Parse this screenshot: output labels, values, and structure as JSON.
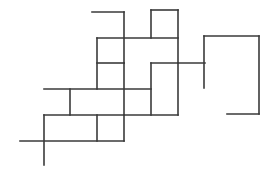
{
  "canvas": {
    "width": 269,
    "height": 176,
    "background_color": "#ffffff",
    "title": "orthogonal-line-drawing"
  },
  "style": {
    "stroke_color": "#3a3a3a",
    "stroke_width": 1.6,
    "fill": "none",
    "line_cap": "square",
    "line_join": "miter"
  },
  "figure": {
    "segment_count": 24
  },
  "segments": [
    {
      "name": "top-left-horizontal",
      "orientation": "horizontal",
      "x1": 92,
      "y1": 12,
      "x2": 124,
      "y2": 12
    },
    {
      "name": "top-left-vertical",
      "orientation": "vertical",
      "x1": 124,
      "y1": 12,
      "x2": 124,
      "y2": 63
    },
    {
      "name": "top-square-top-edge",
      "orientation": "horizontal",
      "x1": 151,
      "y1": 10,
      "x2": 178,
      "y2": 10
    },
    {
      "name": "top-square-left-edge",
      "orientation": "vertical",
      "x1": 151,
      "y1": 10,
      "x2": 151,
      "y2": 38
    },
    {
      "name": "top-square-right-edge",
      "orientation": "vertical",
      "x1": 178,
      "y1": 10,
      "x2": 178,
      "y2": 63
    },
    {
      "name": "upper-mid-horizontal",
      "orientation": "horizontal",
      "x1": 97,
      "y1": 38,
      "x2": 178,
      "y2": 38
    },
    {
      "name": "upper-left-vertical",
      "orientation": "vertical",
      "x1": 97,
      "y1": 38,
      "x2": 97,
      "y2": 89
    },
    {
      "name": "center-vertical-long",
      "orientation": "vertical",
      "x1": 124,
      "y1": 63,
      "x2": 124,
      "y2": 115
    },
    {
      "name": "center-left-horizontal",
      "orientation": "horizontal",
      "x1": 97,
      "y1": 63,
      "x2": 124,
      "y2": 63
    },
    {
      "name": "right-connector-horizontal",
      "orientation": "horizontal",
      "x1": 151,
      "y1": 63,
      "x2": 205,
      "y2": 63
    },
    {
      "name": "right-shape-left-vertical",
      "orientation": "vertical",
      "x1": 204,
      "y1": 36,
      "x2": 204,
      "y2": 88
    },
    {
      "name": "right-shape-top-edge",
      "orientation": "horizontal",
      "x1": 204,
      "y1": 36,
      "x2": 259,
      "y2": 36
    },
    {
      "name": "right-shape-right-edge",
      "orientation": "vertical",
      "x1": 259,
      "y1": 36,
      "x2": 259,
      "y2": 114
    },
    {
      "name": "right-shape-bottom-edge",
      "orientation": "horizontal",
      "x1": 259,
      "y1": 114,
      "x2": 227,
      "y2": 114
    },
    {
      "name": "mid-block-left-vertical",
      "orientation": "vertical",
      "x1": 151,
      "y1": 63,
      "x2": 151,
      "y2": 115
    },
    {
      "name": "mid-block-right-vertical",
      "orientation": "vertical",
      "x1": 178,
      "y1": 63,
      "x2": 178,
      "y2": 115
    },
    {
      "name": "mid-long-horizontal",
      "orientation": "horizontal",
      "x1": 44,
      "y1": 89,
      "x2": 151,
      "y2": 89
    },
    {
      "name": "lower-step-vertical",
      "orientation": "vertical",
      "x1": 70,
      "y1": 89,
      "x2": 70,
      "y2": 115
    },
    {
      "name": "lower-long-horizontal",
      "orientation": "horizontal",
      "x1": 44,
      "y1": 115,
      "x2": 178,
      "y2": 115
    },
    {
      "name": "lower-left-vertical",
      "orientation": "vertical",
      "x1": 44,
      "y1": 115,
      "x2": 44,
      "y2": 165
    },
    {
      "name": "bottom-horizontal",
      "orientation": "horizontal",
      "x1": 20,
      "y1": 141,
      "x2": 124,
      "y2": 141
    },
    {
      "name": "bottom-box-vertical",
      "orientation": "vertical",
      "x1": 97,
      "y1": 115,
      "x2": 97,
      "y2": 141
    },
    {
      "name": "bottom-box-right-vertical",
      "orientation": "vertical",
      "x1": 124,
      "y1": 115,
      "x2": 124,
      "y2": 141
    }
  ]
}
